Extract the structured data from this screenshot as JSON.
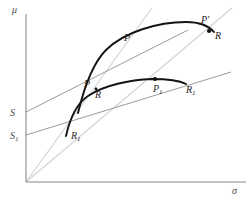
{
  "figure": {
    "type": "economics-diagram",
    "axes": {
      "y_label": "μ",
      "x_label": "σ",
      "origin_px": [
        26,
        182
      ],
      "y_axis_top_px": [
        26,
        14
      ],
      "x_axis_right_px": [
        246,
        182
      ]
    },
    "intercept_labels": [
      {
        "name": "S",
        "text": "S",
        "x": 10,
        "y": 108
      },
      {
        "name": "S1",
        "text": "S",
        "sub": "1",
        "x": 10,
        "y": 131
      }
    ],
    "point_labels": [
      {
        "name": "P-upper",
        "text": "P",
        "sub": "",
        "x": 124,
        "y": 33
      },
      {
        "name": "P-prime",
        "text": "P",
        "sub": "",
        "prime": "′",
        "x": 201,
        "y": 15
      },
      {
        "name": "R-upper",
        "text": "R",
        "sub": "",
        "x": 215,
        "y": 31
      },
      {
        "name": "P-lower",
        "text": "P",
        "sub": "",
        "x": 84,
        "y": 79
      },
      {
        "name": "R-lower",
        "text": "R",
        "sub": "",
        "x": 95,
        "y": 90
      },
      {
        "name": "P1",
        "text": "P",
        "sub": "1",
        "x": 153,
        "y": 84
      },
      {
        "name": "R1-right",
        "text": "R",
        "sub": "1",
        "x": 186,
        "y": 85
      },
      {
        "name": "R1-left",
        "text": "R",
        "sub": "1",
        "x": 71,
        "y": 131
      }
    ],
    "lines": {
      "ray_steep": {
        "from": [
          26,
          182
        ],
        "to": [
          152,
          8
        ],
        "color": "#d2d2d2"
      },
      "ray_shallow": {
        "from": [
          26,
          182
        ],
        "to": [
          232,
          8
        ],
        "color": "#d2d2d2"
      },
      "tangent_S": {
        "from": [
          26,
          112
        ],
        "to": [
          188,
          30
        ],
        "color": "#9b9b9b"
      },
      "tangent_S1": {
        "from": [
          26,
          135
        ],
        "to": [
          231,
          72
        ],
        "color": "#9b9b9b"
      }
    },
    "curves": {
      "upper_frontier": "M 78,113 C 84,88 92,64 106,50 C 124,32 158,22 186,22 C 200,22 208,25 214,32",
      "lower_frontier": "M 66,136 C 70,118 76,104 88,96 C 104,85 130,80 152,79 C 166,79 178,80 186,84"
    },
    "dots": [
      {
        "name": "P-prime-dot",
        "cx": 209,
        "cy": 31,
        "r": 2.1
      },
      {
        "name": "P1-dot",
        "cx": 155,
        "cy": 79,
        "r": 2.1
      },
      {
        "name": "P-lower-dot",
        "cx": 96,
        "cy": 89,
        "r": 1.4
      }
    ]
  }
}
